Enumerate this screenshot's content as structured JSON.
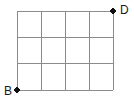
{
  "figure": {
    "title": "",
    "background_color": "#ffffff",
    "line_color": "#8c8c8c",
    "line_width": 1,
    "marker_color": "#101010",
    "label_color": "#1a1a1a"
  },
  "grid": {
    "columns": 4,
    "rows": 3,
    "cell_width": 24,
    "cell_height": 26.3,
    "x_positions": [
      17,
      41,
      65,
      89,
      113
    ],
    "y_positions": [
      11,
      37.3,
      63.7,
      90
    ],
    "left": 17,
    "right": 113,
    "top": 11,
    "bottom": 90,
    "width": 96,
    "height": 79
  },
  "points": [
    {
      "name": "B",
      "label": "B",
      "x": 17,
      "y": 90,
      "corner": "bottom-left",
      "marker": "filled-dot",
      "marker_radius": 2.6,
      "label_position": "left"
    },
    {
      "name": "D",
      "label": "D",
      "x": 113,
      "y": 11,
      "corner": "top-right",
      "marker": "filled-dot",
      "marker_radius": 2.6,
      "label_position": "right"
    }
  ],
  "chart_data": {
    "type": "diagram",
    "vertical_lines": [
      17,
      41,
      65,
      89,
      113
    ],
    "horizontal_lines": [
      11,
      37.3,
      63.7,
      90
    ],
    "marked_points": [
      {
        "label": "B",
        "x": 17,
        "y": 90
      },
      {
        "label": "D",
        "x": 113,
        "y": 11
      }
    ]
  }
}
